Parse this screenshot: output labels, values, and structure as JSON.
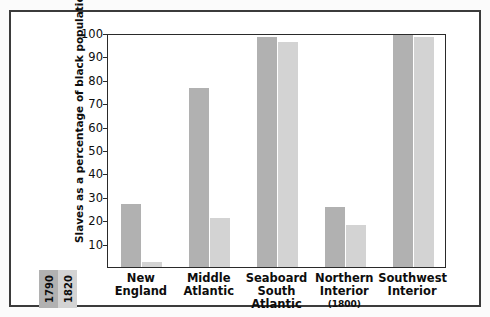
{
  "chart_data": {
    "type": "bar",
    "title": "",
    "xlabel": "",
    "ylabel": "Slaves as a percentage of black population",
    "ylim": [
      0,
      100
    ],
    "yticks": [
      10,
      20,
      30,
      40,
      50,
      60,
      70,
      80,
      90,
      100
    ],
    "grid": false,
    "legend_position": "bottom-left",
    "categories": [
      "New England",
      "Middle Atlantic",
      "Seaboard South Atlantic",
      "Northern Interior",
      "Southwest Interior"
    ],
    "category_lines": [
      [
        "New",
        "England"
      ],
      [
        "Middle",
        "Atlantic"
      ],
      [
        "Seaboard",
        "South",
        "Atlantic"
      ],
      [
        "Northern",
        "Interior"
      ],
      [
        "Southwest",
        "Interior"
      ]
    ],
    "category_notes": [
      "",
      "",
      "",
      "(1800)",
      ""
    ],
    "series": [
      {
        "name": "1790",
        "color": "#b1b1b1",
        "values": [
          27,
          77,
          99,
          26,
          100
        ]
      },
      {
        "name": "1820",
        "color": "#d3d3d3",
        "values": [
          2,
          21,
          97,
          18,
          99
        ]
      }
    ]
  },
  "legend": {
    "entries": [
      {
        "label": "1790",
        "color": "#b1b1b1"
      },
      {
        "label": "1820",
        "color": "#d3d3d3"
      }
    ]
  },
  "axis": {
    "y_title": "Slaves as a percentage of black population",
    "tick_labels": [
      "100",
      "90",
      "80",
      "70",
      "60",
      "50",
      "40",
      "30",
      "20",
      "10"
    ]
  },
  "colors": {
    "frame": "#3b3b3b",
    "plot_border": "#2a2a2a",
    "bar_1790": "#b1b1b1",
    "bar_1820": "#d3d3d3",
    "background": "#ffffff",
    "text": "#0d0d0d"
  }
}
